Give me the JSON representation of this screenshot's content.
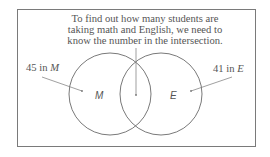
{
  "caption": {
    "line1": "To find out how many students are",
    "line2": "taking math and English, we need to",
    "line3": "know the number in the intersection."
  },
  "left_set": {
    "count": "45",
    "in_word": "in",
    "letter": "M",
    "region_label": "M"
  },
  "right_set": {
    "count": "41",
    "in_word": "in",
    "letter": "E",
    "region_label": "E"
  },
  "colors": {
    "stroke": "#666666",
    "frame": "#7a7a7a",
    "text": "#555555"
  }
}
